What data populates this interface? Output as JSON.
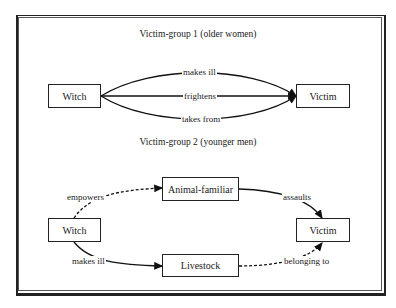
{
  "corner_mark": "77",
  "group1": {
    "title": "Victim-group 1 (older women)",
    "nodes": {
      "witch": "Witch",
      "victim": "Victim"
    },
    "edges": [
      {
        "label": "makes ill",
        "style": "solid"
      },
      {
        "label": "frightens",
        "style": "solid"
      },
      {
        "label": "takes from",
        "style": "solid"
      }
    ]
  },
  "group2": {
    "title": "Victim-group 2 (younger men)",
    "nodes": {
      "witch": "Witch",
      "familiar": "Animal-familiar",
      "livestock": "Livestock",
      "victim": "Victim"
    },
    "edges": [
      {
        "label": "empowers",
        "style": "dashed"
      },
      {
        "label": "assaults",
        "style": "solid"
      },
      {
        "label": "makes ill",
        "style": "solid"
      },
      {
        "label": "belonging to",
        "style": "dashed"
      }
    ]
  }
}
